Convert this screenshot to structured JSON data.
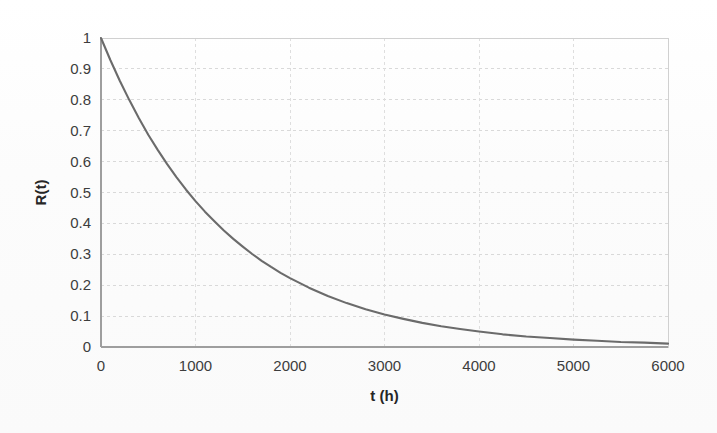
{
  "figure": {
    "background_color": "#fdfdfd",
    "plot_area": {
      "left": 101,
      "top": 38,
      "right": 668,
      "bottom": 347
    }
  },
  "chart_data": {
    "type": "line",
    "title": "",
    "subtitle": "",
    "xlabel": "t (h)",
    "ylabel": "R(t)",
    "xlim": [
      0,
      6000
    ],
    "ylim": [
      0,
      1
    ],
    "grid": true,
    "legend": false,
    "legend_position": "none",
    "line_color": "#6b6b6b",
    "gridline_color": "#d9d9d9",
    "axis_color": "#9e9e9e",
    "tick_label_color": "#3d3d3d",
    "x_ticks": [
      0,
      1000,
      2000,
      3000,
      4000,
      5000,
      6000
    ],
    "x_tick_labels": [
      "0",
      "1000",
      "2000",
      "3000",
      "4000",
      "5000",
      "6000"
    ],
    "y_ticks": [
      0,
      0.1,
      0.2,
      0.3,
      0.4,
      0.5,
      0.6,
      0.7,
      0.8,
      0.9,
      1
    ],
    "y_tick_labels": [
      "0",
      "0.1",
      "0.2",
      "0.3",
      "0.4",
      "0.5",
      "0.6",
      "0.7",
      "0.8",
      "0.9",
      "1"
    ],
    "function": "R(t) = exp(-lambda * t)",
    "lambda": 0.00075,
    "series": [
      {
        "name": "R(t)",
        "x": [
          0,
          100,
          200,
          300,
          400,
          500,
          600,
          700,
          800,
          900,
          1000,
          1100,
          1200,
          1300,
          1400,
          1500,
          1600,
          1700,
          1800,
          1900,
          2000,
          2200,
          2400,
          2600,
          2800,
          3000,
          3200,
          3400,
          3600,
          3800,
          4000,
          4250,
          4500,
          4750,
          5000,
          5250,
          5500,
          5750,
          6000
        ],
        "values": [
          1.0,
          0.928,
          0.861,
          0.799,
          0.741,
          0.687,
          0.638,
          0.592,
          0.549,
          0.509,
          0.472,
          0.438,
          0.407,
          0.377,
          0.35,
          0.325,
          0.301,
          0.279,
          0.259,
          0.24,
          0.223,
          0.192,
          0.165,
          0.142,
          0.122,
          0.105,
          0.091,
          0.078,
          0.067,
          0.058,
          0.05,
          0.041,
          0.034,
          0.029,
          0.024,
          0.02,
          0.016,
          0.014,
          0.011
        ]
      }
    ],
    "annotations": []
  }
}
